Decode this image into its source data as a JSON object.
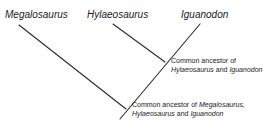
{
  "taxa": {
    "megalosaurus": "Megalosaurus",
    "hylaeosaurus": "Hylaeosaurus",
    "iguanodon": "Iguanodon"
  },
  "nodes": {
    "upper": {
      "line1": "Common ancestor of",
      "line2_a": "Hylaeosaurus",
      "line2_b": " and ",
      "line2_c": "Iguanodon"
    },
    "lower": {
      "line1_a": "Common ancestor of ",
      "line1_b": "Megalosaurus,",
      "line2_a": "Hylaeosaurus",
      "line2_b": " and ",
      "line2_c": "Iguanodon"
    }
  },
  "colors": {
    "line": "#2a2a2a",
    "text": "#222222"
  }
}
